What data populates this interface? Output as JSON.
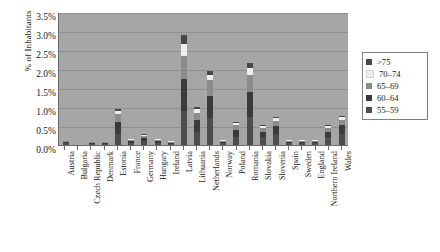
{
  "chart_data": {
    "type": "bar",
    "stacked": true,
    "title": "",
    "xlabel": "",
    "ylabel": "% of Inhabitants",
    "ylim": [
      0,
      3.5
    ],
    "ytick_labels": [
      "3.5%",
      "3.0%",
      "2.5%",
      "2.0%",
      "1.5%",
      "1.0%",
      "0.5%",
      "0.0%"
    ],
    "ytick_values": [
      3.5,
      3.0,
      2.5,
      2.0,
      1.5,
      1.0,
      0.5,
      0.0
    ],
    "grid": true,
    "legend_position": "right",
    "categories": [
      "Austria",
      "Bulgaria",
      "Czech Republic",
      "Denmark",
      "Estonia",
      "France",
      "Germany",
      "Hungary",
      "Ireland",
      "Latvia",
      "Lithuania",
      "Netherlands",
      "Norway",
      "Poland",
      "Romania",
      "Slovakia",
      "Slovenia",
      "Spain",
      "Sweden",
      "England",
      "Northern Ireland",
      "Wales"
    ],
    "series": [
      {
        "name": "55–59",
        "color": "#4d4d4d",
        "values": [
          0.04,
          0.0,
          0.02,
          0.02,
          0.3,
          0.06,
          0.1,
          0.06,
          0.03,
          0.9,
          0.35,
          0.7,
          0.04,
          0.22,
          0.75,
          0.2,
          0.28,
          0.05,
          0.04,
          0.04,
          0.2,
          0.28
        ]
      },
      {
        "name": "60–64",
        "color": "#3a3a3a",
        "values": [
          0.04,
          0.0,
          0.02,
          0.02,
          0.3,
          0.05,
          0.08,
          0.05,
          0.03,
          0.85,
          0.3,
          0.6,
          0.04,
          0.18,
          0.65,
          0.15,
          0.22,
          0.04,
          0.04,
          0.04,
          0.15,
          0.24
        ]
      },
      {
        "name": "65–69",
        "color": "#8c8c8c",
        "values": [
          0.02,
          0.0,
          0.01,
          0.01,
          0.22,
          0.03,
          0.05,
          0.03,
          0.02,
          0.6,
          0.2,
          0.4,
          0.02,
          0.12,
          0.45,
          0.1,
          0.14,
          0.02,
          0.02,
          0.02,
          0.1,
          0.15
        ]
      },
      {
        "name": "70–74",
        "color": "#ededed",
        "values": [
          0.0,
          0.0,
          0.0,
          0.0,
          0.08,
          0.01,
          0.02,
          0.01,
          0.01,
          0.3,
          0.1,
          0.15,
          0.01,
          0.05,
          0.18,
          0.04,
          0.06,
          0.01,
          0.01,
          0.01,
          0.04,
          0.06
        ]
      },
      {
        "name": ">75",
        "color": "#474747",
        "values": [
          0.0,
          0.0,
          0.0,
          0.0,
          0.05,
          0.0,
          0.01,
          0.0,
          0.0,
          0.25,
          0.05,
          0.1,
          0.0,
          0.03,
          0.12,
          0.02,
          0.04,
          0.0,
          0.0,
          0.0,
          0.02,
          0.04
        ]
      }
    ],
    "totals": [
      0.1,
      0.0,
      0.05,
      0.05,
      0.95,
      0.15,
      0.26,
      0.15,
      0.09,
      2.9,
      1.0,
      1.95,
      0.11,
      0.6,
      2.15,
      0.51,
      0.74,
      0.12,
      0.11,
      0.11,
      0.51,
      0.77
    ]
  },
  "legend": {
    "items": [
      {
        "label": ">75",
        "color": "#474747"
      },
      {
        "label": "70–74",
        "color": "#ededed"
      },
      {
        "label": "65–69",
        "color": "#8c8c8c"
      },
      {
        "label": "60–64",
        "color": "#3a3a3a"
      },
      {
        "label": "55–59",
        "color": "#4d4d4d"
      }
    ]
  },
  "style": {
    "plot_background": "#a6a6a6",
    "gridline_color": "#8f8f8f",
    "axis_color": "#6b6b6b",
    "page_background": "#ffffff",
    "text_color": "#1a1a1a"
  }
}
